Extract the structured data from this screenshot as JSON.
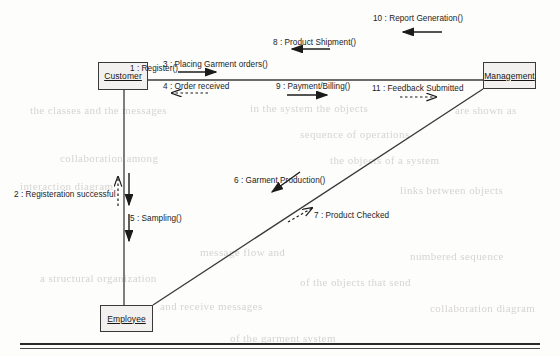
{
  "diagram": {
    "title": "Collaboration Diagram",
    "type": "uml-collaboration-diagram"
  },
  "actors": [
    {
      "id": "customer",
      "label": "Customer",
      "x": 98,
      "y": 62,
      "w": 50,
      "h": 28
    },
    {
      "id": "management",
      "label": "Management",
      "x": 483,
      "y": 62,
      "w": 53,
      "h": 27
    },
    {
      "id": "employee",
      "label": "Employee",
      "x": 100,
      "y": 305,
      "w": 53,
      "h": 27
    }
  ],
  "messages": [
    {
      "num": "1",
      "text": "1 : Register()",
      "x": 130,
      "y": 180,
      "style": "solid",
      "direction": "down"
    },
    {
      "num": "2",
      "text": "2 : Registeration successful",
      "x": 14,
      "y": 192,
      "style": "dashed",
      "direction": "up"
    },
    {
      "num": "3",
      "text": "3 : Placing Garment orders()",
      "x": 163,
      "y": 60,
      "style": "solid",
      "direction": "right"
    },
    {
      "num": "4",
      "text": "4 : Order received",
      "x": 163,
      "y": 82,
      "style": "dashed",
      "direction": "left"
    },
    {
      "num": "5",
      "text": "5 : Sampling()",
      "x": 130,
      "y": 219,
      "style": "solid",
      "direction": "down"
    },
    {
      "num": "6",
      "text": "6 : Garment Production()",
      "x": 234,
      "y": 180,
      "style": "solid",
      "direction": "down-left"
    },
    {
      "num": "7",
      "text": "7 : Product Checked",
      "x": 312,
      "y": 215,
      "style": "dashed",
      "direction": "up-right"
    },
    {
      "num": "8",
      "text": "8 : Product Shipment()",
      "x": 273,
      "y": 38,
      "style": "solid",
      "direction": "left"
    },
    {
      "num": "9",
      "text": "9 : Payment/Billing()",
      "x": 276,
      "y": 82,
      "style": "solid",
      "direction": "right"
    },
    {
      "num": "10",
      "text": "10 : Report Generation()",
      "x": 373,
      "y": 14,
      "style": "solid",
      "direction": "left"
    },
    {
      "num": "11",
      "text": "11 : Feedback Submitted",
      "x": 372,
      "y": 84,
      "style": "dashed",
      "direction": "right"
    }
  ],
  "links": [
    {
      "id": "customer-management",
      "from": "customer",
      "to": "management",
      "kind": "horizontal"
    },
    {
      "id": "customer-employee",
      "from": "customer",
      "to": "employee",
      "kind": "vertical"
    },
    {
      "id": "employee-management",
      "from": "employee",
      "to": "management",
      "kind": "diagonal"
    }
  ],
  "colors": {
    "ink": "#1b1b1b",
    "line": "#3a3a3a",
    "box_fill": "#f2f1ef",
    "page": "#fdfdfc",
    "ghost": "#c9c7c3"
  },
  "ghost_text": [
    {
      "text": "the classes and the messages",
      "x": 30,
      "y": 104
    },
    {
      "text": "in the system the objects",
      "x": 250,
      "y": 102
    },
    {
      "text": "are shown as",
      "x": 455,
      "y": 104
    },
    {
      "text": "sequence of operations",
      "x": 300,
      "y": 128
    },
    {
      "text": "collaboration among",
      "x": 60,
      "y": 152
    },
    {
      "text": "the objects of a system",
      "x": 330,
      "y": 154
    },
    {
      "text": "interaction diagram",
      "x": 20,
      "y": 180
    },
    {
      "text": "links between objects",
      "x": 400,
      "y": 184
    },
    {
      "text": "message flow and",
      "x": 200,
      "y": 246
    },
    {
      "text": "numbered sequence",
      "x": 410,
      "y": 250
    },
    {
      "text": "a structural organization",
      "x": 40,
      "y": 272
    },
    {
      "text": "of the objects that send",
      "x": 300,
      "y": 276
    },
    {
      "text": "and receive messages",
      "x": 160,
      "y": 300
    },
    {
      "text": "collaboration diagram",
      "x": 430,
      "y": 302
    },
    {
      "text": "of the garment system",
      "x": 230,
      "y": 332
    }
  ],
  "footer": {
    "rule_label": "page-rule"
  }
}
